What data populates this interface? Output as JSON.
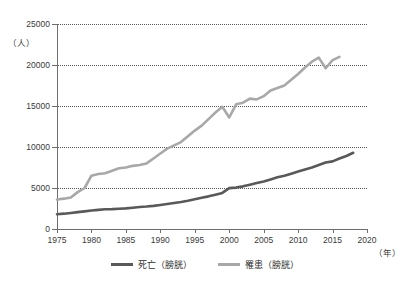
{
  "chart_data": {
    "type": "line",
    "title": "",
    "subtitle": "",
    "xlabel": "（年）",
    "ylabel": "（人）",
    "xlim": [
      1975,
      2020
    ],
    "ylim": [
      0,
      25000
    ],
    "grid": true,
    "legend_position": "bottom-center",
    "x_ticks": [
      "1975",
      "1980",
      "1985",
      "1990",
      "1995",
      "2000",
      "2005",
      "2010",
      "2015",
      "2020"
    ],
    "x_tick_values": [
      1975,
      1980,
      1985,
      1990,
      1995,
      2000,
      2005,
      2010,
      2015,
      2020
    ],
    "y_ticks": [
      "0",
      "5000",
      "10000",
      "15000",
      "20000",
      "25000"
    ],
    "y_tick_values": [
      0,
      5000,
      10000,
      15000,
      20000,
      25000
    ],
    "series": [
      {
        "name": "死亡（膀胱）",
        "color": "#595959",
        "x": [
          1975,
          1976,
          1977,
          1978,
          1979,
          1980,
          1981,
          1982,
          1983,
          1984,
          1985,
          1986,
          1987,
          1988,
          1989,
          1990,
          1991,
          1992,
          1993,
          1994,
          1995,
          1996,
          1997,
          1998,
          1999,
          2000,
          2001,
          2002,
          2003,
          2004,
          2005,
          2006,
          2007,
          2008,
          2009,
          2010,
          2011,
          2012,
          2013,
          2014,
          2015,
          2016,
          2017,
          2018
        ],
        "values": [
          1800,
          1870,
          1960,
          2060,
          2150,
          2250,
          2330,
          2400,
          2420,
          2470,
          2520,
          2600,
          2680,
          2740,
          2820,
          2930,
          3050,
          3180,
          3300,
          3450,
          3620,
          3800,
          3980,
          4180,
          4400,
          4980,
          5050,
          5200,
          5400,
          5600,
          5800,
          6050,
          6300,
          6500,
          6750,
          7000,
          7250,
          7500,
          7800,
          8100,
          8250,
          8600,
          8900,
          9300
        ]
      },
      {
        "name": "罹患（膀胱）",
        "color": "#a8a8a8",
        "x": [
          1975,
          1976,
          1977,
          1978,
          1979,
          1980,
          1981,
          1982,
          1983,
          1984,
          1985,
          1986,
          1987,
          1988,
          1989,
          1990,
          1991,
          1992,
          1993,
          1994,
          1995,
          1996,
          1997,
          1998,
          1999,
          2000,
          2001,
          2002,
          2003,
          2004,
          2005,
          2006,
          2007,
          2008,
          2009,
          2010,
          2011,
          2012,
          2013,
          2014,
          2015,
          2016
        ],
        "values": [
          3600,
          3700,
          3850,
          4500,
          5000,
          6500,
          6700,
          6800,
          7100,
          7400,
          7500,
          7700,
          7800,
          8000,
          8600,
          9200,
          9800,
          10200,
          10600,
          11300,
          12000,
          12600,
          13400,
          14200,
          14900,
          13600,
          15200,
          15400,
          15900,
          15800,
          16200,
          16900,
          17200,
          17500,
          18200,
          18900,
          19700,
          20400,
          20900,
          19600,
          20600,
          21000
        ]
      }
    ]
  }
}
